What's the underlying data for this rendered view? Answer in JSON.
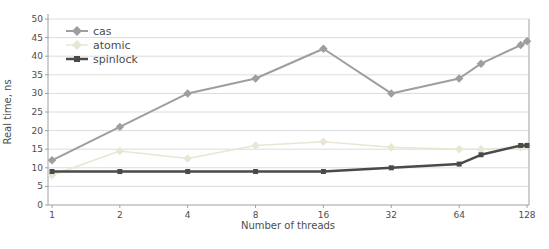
{
  "chart_data": {
    "type": "line",
    "title": "",
    "xlabel": "Number of threads",
    "ylabel": "Real time, ns",
    "x_scale": "log2",
    "grid": "horizontal",
    "legend_position": "top-left",
    "x_tick_labels": [
      "1",
      "2",
      "4",
      "8",
      "16",
      "32",
      "64",
      "128"
    ],
    "x_tick_values": [
      1,
      2,
      4,
      8,
      16,
      32,
      64,
      128
    ],
    "ylim": [
      0,
      50
    ],
    "y_tick_step": 5,
    "x": [
      1,
      2,
      4,
      8,
      16,
      32,
      64,
      80,
      120,
      128
    ],
    "series": [
      {
        "name": "cas",
        "color": "#9e9e9e",
        "marker": "diamond",
        "line_width": 2,
        "values": [
          12,
          21,
          30,
          34,
          42,
          30,
          34,
          38,
          43,
          44
        ]
      },
      {
        "name": "atomic",
        "color": "#e9e6d4",
        "marker": "diamond",
        "line_width": 1.5,
        "values": [
          8,
          14.5,
          12.5,
          16,
          17,
          15.5,
          15,
          15,
          15.5,
          16
        ]
      },
      {
        "name": "spinlock",
        "color": "#4a4a4a",
        "marker": "square",
        "line_width": 2.5,
        "values": [
          9,
          9,
          9,
          9,
          9,
          10,
          11,
          13.5,
          16,
          16
        ]
      }
    ]
  },
  "style": {
    "grid_color": "#dcdcdc",
    "axis_color": "#a0a0a0",
    "tick_text_color": "#4d4d4d",
    "background": "#ffffff"
  }
}
